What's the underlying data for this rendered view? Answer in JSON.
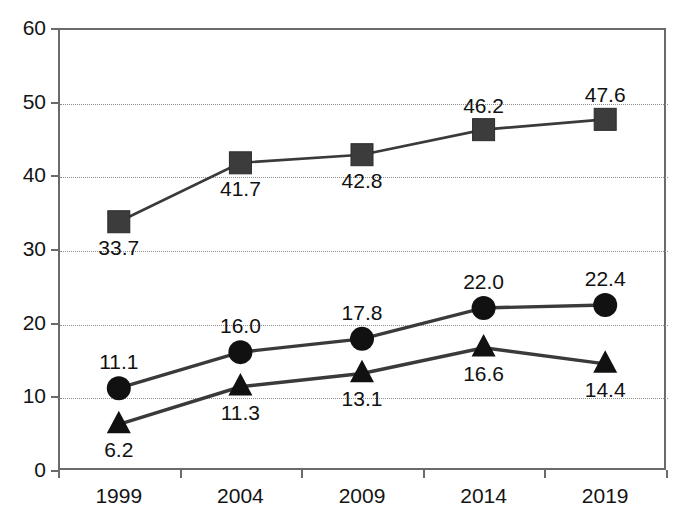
{
  "chart_data": {
    "type": "line",
    "title": "",
    "subtitle": "",
    "xlabel": "",
    "ylabel": "",
    "categories": [
      "1999",
      "2004",
      "2009",
      "2014",
      "2019"
    ],
    "ylim": [
      0,
      60
    ],
    "y_ticks": [
      "0",
      "10",
      "20",
      "30",
      "40",
      "50",
      "60"
    ],
    "grid": "horizontal dotted gridlines at 10,20,30,40,50",
    "legend": "none",
    "series": [
      {
        "name": "series-square",
        "marker": "square",
        "color": "#3c3c3c",
        "values": [
          33.7,
          41.7,
          42.8,
          46.2,
          47.6
        ],
        "labels": [
          "33.7",
          "41.7",
          "42.8",
          "46.2",
          "47.6"
        ]
      },
      {
        "name": "series-circle",
        "marker": "circle",
        "color": "#111111",
        "values": [
          11.1,
          16.0,
          17.8,
          22.0,
          22.4
        ],
        "labels": [
          "11.1",
          "16.0",
          "17.8",
          "22.0",
          "22.4"
        ]
      },
      {
        "name": "series-triangle",
        "marker": "triangle",
        "color": "#111111",
        "values": [
          6.2,
          11.3,
          13.1,
          16.6,
          14.4
        ],
        "labels": [
          "6.2",
          "11.3",
          "13.1",
          "16.6",
          "14.4"
        ]
      }
    ]
  },
  "axis": {
    "y_ticks": [
      "60",
      "50",
      "40",
      "30",
      "20",
      "10",
      "0"
    ],
    "x_ticks": [
      "1999",
      "2004",
      "2009",
      "2014",
      "2019"
    ]
  },
  "colors": {
    "frame": "#6a6a6a",
    "grid": "#8d8d8d",
    "square_marker": "#3c3c3c",
    "dark_marker": "#111111",
    "line": "#3a3a3a",
    "text": "#141414"
  }
}
